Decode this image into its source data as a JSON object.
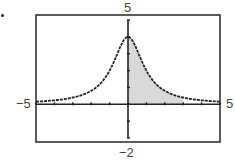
{
  "chart_data": {
    "type": "line",
    "title": "",
    "xlabel": "",
    "ylabel": "",
    "function": "y = 4/(x^2 + 1)",
    "xlim": [
      -5,
      5
    ],
    "ylim": [
      -2,
      5
    ],
    "window_labels": {
      "xmin": "−5",
      "xmax": "5",
      "ymin": "−2",
      "ymax": "5"
    },
    "x_ticks": [
      -5,
      -4,
      -3,
      -2,
      -1,
      0,
      1,
      2,
      3,
      4,
      5
    ],
    "y_ticks": [
      -2,
      -1,
      0,
      1,
      2,
      3,
      4,
      5
    ],
    "grid": false,
    "shaded_region": {
      "from_x": 0,
      "to_x": 3,
      "below": "curve",
      "above": "x-axis",
      "color": "#d9d9d9"
    },
    "series": [
      {
        "name": "f(x)",
        "x": [
          -5,
          -4,
          -3,
          -2,
          -1,
          -0.5,
          0,
          0.5,
          1,
          2,
          3,
          4,
          5
        ],
        "y": [
          0.15,
          0.24,
          0.4,
          0.8,
          2.0,
          3.2,
          4.0,
          3.2,
          2.0,
          0.8,
          0.4,
          0.24,
          0.15
        ]
      }
    ],
    "colors": {
      "curve": "#222222",
      "axes": "#222222",
      "frame": "#333333",
      "fill": "#d9d9d9"
    }
  }
}
